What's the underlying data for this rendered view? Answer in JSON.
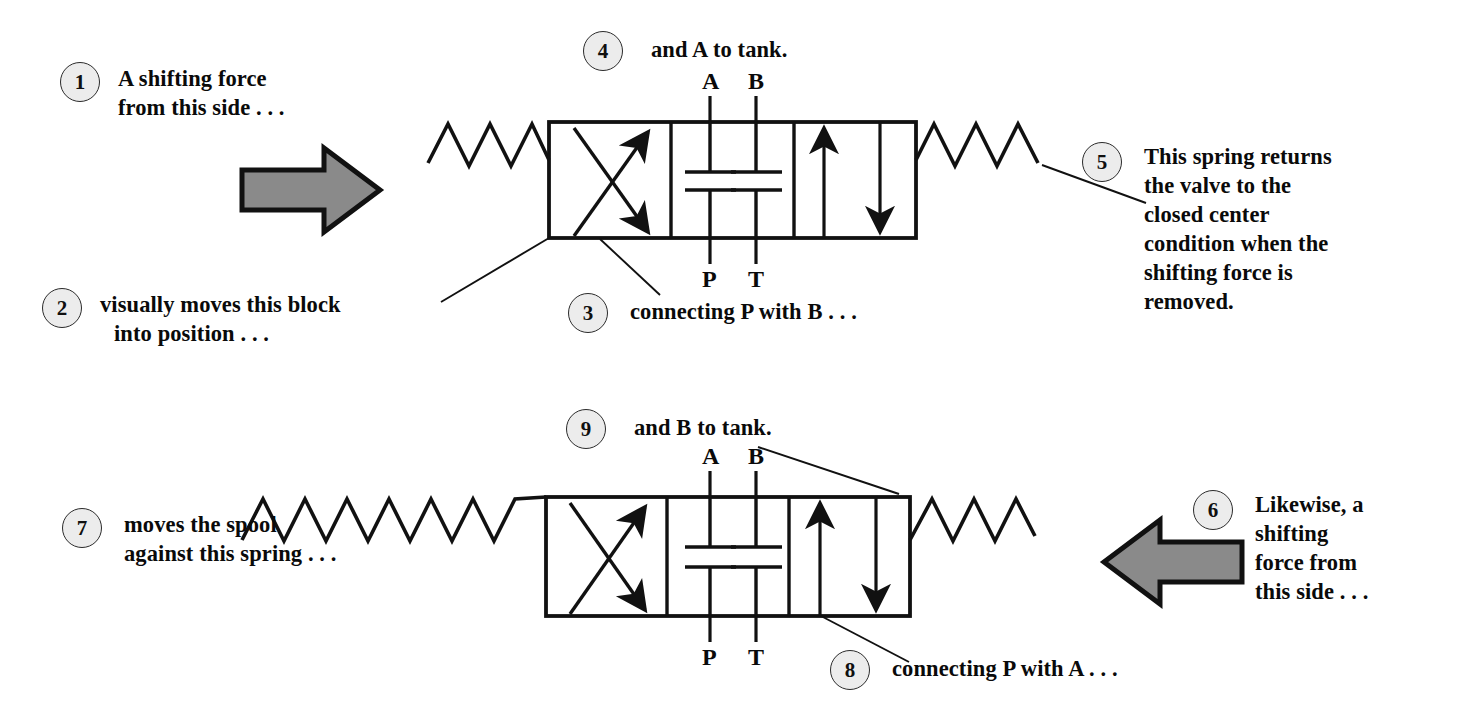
{
  "figure": {
    "ink_color": "#111111",
    "gray_arrow_fill": "#8a8a8a",
    "gray_arrow_stroke": "#111111",
    "badge_fill": "#ececec"
  },
  "callouts": [
    {
      "id": "1",
      "number": "1",
      "lines": [
        "A shifting force",
        "from this side . . ."
      ]
    },
    {
      "id": "2",
      "number": "2",
      "lines": [
        "visually moves this block",
        "into position . . ."
      ]
    },
    {
      "id": "3",
      "number": "3",
      "lines": [
        "connecting P with B . . ."
      ]
    },
    {
      "id": "4",
      "number": "4",
      "lines": [
        "and A to tank."
      ]
    },
    {
      "id": "5",
      "number": "5",
      "lines": [
        "This spring returns",
        "the valve to the",
        "closed center",
        "condition when the",
        "shifting force is",
        "removed."
      ]
    },
    {
      "id": "6",
      "number": "6",
      "lines": [
        "Likewise, a",
        "shifting",
        "force from",
        "this side . . ."
      ]
    },
    {
      "id": "7",
      "number": "7",
      "lines": [
        "moves the spool",
        "against this spring . . ."
      ]
    },
    {
      "id": "8",
      "number": "8",
      "lines": [
        "connecting P with A . . ."
      ]
    },
    {
      "id": "9",
      "number": "9",
      "lines": [
        "and B to tank."
      ]
    }
  ],
  "valves": [
    {
      "id": "upper-valve",
      "position_state": "shifted-left",
      "port_labels_top": [
        "A",
        "B"
      ],
      "port_labels_bottom": [
        "P",
        "T"
      ],
      "envelopes": [
        "crossed-flow",
        "closed-center",
        "parallel-flow"
      ]
    },
    {
      "id": "lower-valve",
      "position_state": "shifted-right",
      "port_labels_top": [
        "A",
        "B"
      ],
      "port_labels_bottom": [
        "P",
        "T"
      ],
      "envelopes": [
        "crossed-flow",
        "closed-center",
        "parallel-flow"
      ]
    }
  ],
  "port_labels": {
    "a": "A",
    "b": "B",
    "p": "P",
    "t": "T"
  }
}
